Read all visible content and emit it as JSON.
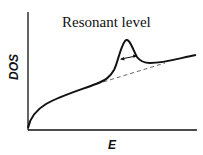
{
  "diagram": {
    "title": "Resonant level",
    "x_axis_label": "E",
    "y_axis_label": "DOS",
    "colors": {
      "curve": "#111111",
      "dashed": "#555555",
      "axis": "#111111"
    },
    "elements": [
      {
        "name": "dos-curve",
        "description": "density of states rising with energy, with a resonant peak"
      },
      {
        "name": "background-dashed-line",
        "description": "unperturbed DOS baseline under the peak"
      },
      {
        "name": "width-arrow",
        "description": "double-headed arrow indicating peak width"
      }
    ]
  }
}
